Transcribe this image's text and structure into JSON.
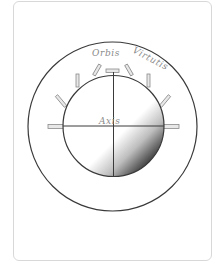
{
  "diagram": {
    "title_left": "Orbis",
    "title_right": "Virtutis",
    "center_label": "Axis",
    "colors": {
      "stroke": "#3a3a3a",
      "rod_fill": "#e8e8e8",
      "rod_stroke": "#8a8a8a",
      "text": "#8a8a8a",
      "gradient_light": "#ffffff",
      "gradient_dark": "#1a1a1a",
      "card_border": "#d8d8d8"
    },
    "outer_circle": {
      "cx": 112.5,
      "cy": 126.5,
      "r": 84.5
    },
    "inner_circle": {
      "cx": 113.5,
      "cy": 126,
      "r": 50.5
    },
    "rods_count": 7
  }
}
